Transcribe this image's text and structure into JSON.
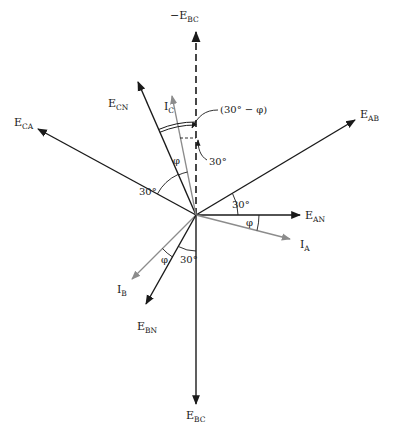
{
  "diagram": {
    "type": "phasor-diagram",
    "origin": [
      196,
      215
    ],
    "colors": {
      "voltage": "#1a1a1a",
      "current": "#8c8c8c",
      "dashed": "#1a1a1a"
    },
    "phasors": [
      {
        "id": "neg_ebc",
        "main": "−E",
        "sub": "BC",
        "tip": [
          196,
          30
        ],
        "style": "dashed",
        "label_pos": [
          170,
          19
        ]
      },
      {
        "id": "ebc",
        "main": "E",
        "sub": "BC",
        "tip": [
          196,
          404
        ],
        "style": "voltage",
        "label_pos": [
          186,
          419
        ]
      },
      {
        "id": "eca",
        "main": "E",
        "sub": "CA",
        "tip": [
          38,
          129
        ],
        "style": "voltage",
        "label_pos": [
          14,
          126
        ]
      },
      {
        "id": "eab",
        "main": "E",
        "sub": "AB",
        "tip": [
          355,
          120
        ],
        "style": "voltage",
        "label_pos": [
          360,
          118
        ]
      },
      {
        "id": "ean",
        "main": "E",
        "sub": "AN",
        "tip": [
          300,
          215
        ],
        "style": "voltage",
        "label_pos": [
          305,
          219
        ]
      },
      {
        "id": "ia",
        "main": "I",
        "sub": "A",
        "tip": [
          290,
          239
        ],
        "style": "current",
        "label_pos": [
          300,
          248
        ]
      },
      {
        "id": "ecn",
        "main": "E",
        "sub": "CN",
        "tip": [
          138,
          82
        ],
        "style": "voltage",
        "label_pos": [
          108,
          107
        ]
      },
      {
        "id": "ic",
        "main": "I",
        "sub": "C",
        "tip": [
          172,
          96
        ],
        "style": "current",
        "label_pos": [
          164,
          110
        ]
      },
      {
        "id": "ib",
        "main": "I",
        "sub": "B",
        "tip": [
          132,
          279
        ],
        "style": "current",
        "label_pos": [
          117,
          293
        ]
      },
      {
        "id": "ebn",
        "main": "E",
        "sub": "BN",
        "tip": [
          146,
          304
        ],
        "style": "voltage",
        "label_pos": [
          137,
          330
        ]
      }
    ],
    "angle_labels": {
      "phase_offset": "(30° − φ)",
      "thirty_ic": "30°",
      "phi_c": "φ",
      "thirty_ca": "30°",
      "thirty_ab": "30°",
      "phi_a": "φ",
      "phi_b": "φ",
      "thirty_bc": "30°"
    }
  }
}
